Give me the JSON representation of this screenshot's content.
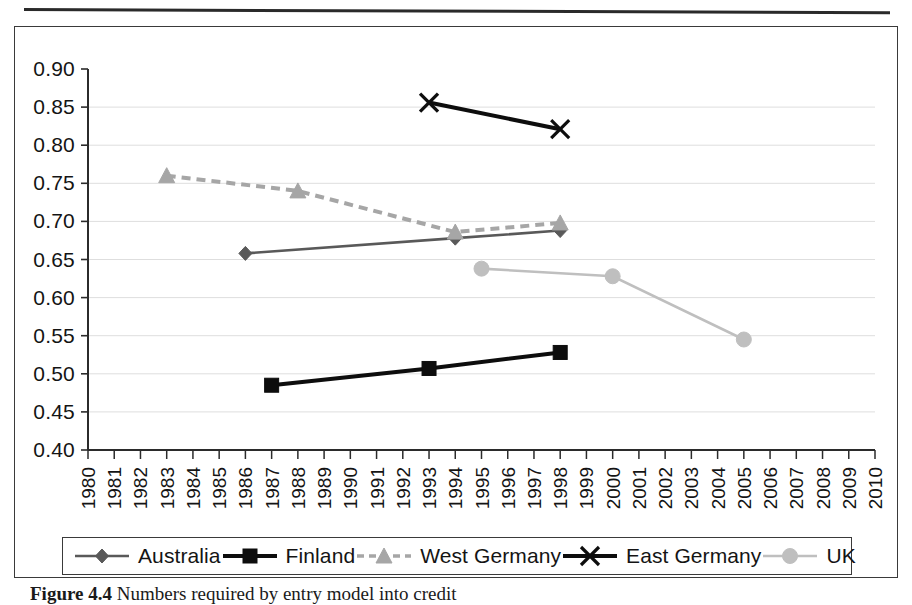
{
  "figure": {
    "caption_label": "Figure 4.4",
    "caption_text": "Numbers required by entry model into credit"
  },
  "legend": {
    "position": "bottom",
    "items": [
      {
        "label": "Australia",
        "marker": "diamond-marker",
        "color": "#595959",
        "line": "solid"
      },
      {
        "label": "Finland",
        "marker": "square-marker",
        "color": "#0d0d0d",
        "line": "solid"
      },
      {
        "label": "West Germany",
        "marker": "triangle-marker",
        "color": "#a6a6a6",
        "line": "dashed"
      },
      {
        "label": "East Germany",
        "marker": "cross-marker",
        "color": "#0d0d0d",
        "line": "solid"
      },
      {
        "label": "UK",
        "marker": "circle-marker",
        "color": "#bfbfbf",
        "line": "solid"
      }
    ]
  },
  "chart_data": {
    "type": "line",
    "title": "",
    "xlabel": "",
    "ylabel": "",
    "xlim": [
      1980,
      2010
    ],
    "ylim": [
      0.4,
      0.9
    ],
    "ytick_step": 0.05,
    "grid": true,
    "grid_axis": "y",
    "x": [
      1980,
      1981,
      1982,
      1983,
      1984,
      1985,
      1986,
      1987,
      1988,
      1989,
      1990,
      1991,
      1992,
      1993,
      1994,
      1995,
      1996,
      1997,
      1998,
      1999,
      2000,
      2001,
      2002,
      2003,
      2004,
      2005,
      2006,
      2007,
      2008,
      2009,
      2010
    ],
    "xtick_labels": [
      "1980",
      "1981",
      "1982",
      "1983",
      "1984",
      "1985",
      "1986",
      "1987",
      "1988",
      "1989",
      "1990",
      "1991",
      "1992",
      "1993",
      "1994",
      "1995",
      "1996",
      "1997",
      "1998",
      "1999",
      "2000",
      "2001",
      "2002",
      "2003",
      "2004",
      "2005",
      "2006",
      "2007",
      "2008",
      "2009",
      "2010"
    ],
    "ytick_labels": [
      "0.90",
      "0.85",
      "0.80",
      "0.75",
      "0.70",
      "0.65",
      "0.60",
      "0.55",
      "0.50",
      "0.45",
      "0.40"
    ],
    "series": [
      {
        "name": "Australia",
        "marker": "diamond",
        "color": "#595959",
        "linestyle": "solid",
        "points": [
          {
            "x": 1986,
            "y": 0.658
          },
          {
            "x": 1994,
            "y": 0.678
          },
          {
            "x": 1998,
            "y": 0.688
          }
        ]
      },
      {
        "name": "Finland",
        "marker": "square",
        "color": "#0d0d0d",
        "linestyle": "solid",
        "points": [
          {
            "x": 1987,
            "y": 0.485
          },
          {
            "x": 1993,
            "y": 0.507
          },
          {
            "x": 1998,
            "y": 0.528
          }
        ]
      },
      {
        "name": "West Germany",
        "marker": "triangle",
        "color": "#a6a6a6",
        "linestyle": "dashed",
        "points": [
          {
            "x": 1983,
            "y": 0.76
          },
          {
            "x": 1988,
            "y": 0.74
          },
          {
            "x": 1994,
            "y": 0.686
          },
          {
            "x": 1998,
            "y": 0.698
          }
        ]
      },
      {
        "name": "East Germany",
        "marker": "cross",
        "color": "#0d0d0d",
        "linestyle": "solid",
        "points": [
          {
            "x": 1993,
            "y": 0.856
          },
          {
            "x": 1998,
            "y": 0.821
          }
        ]
      },
      {
        "name": "UK",
        "marker": "circle",
        "color": "#bfbfbf",
        "linestyle": "solid",
        "points": [
          {
            "x": 1995,
            "y": 0.638
          },
          {
            "x": 2000,
            "y": 0.628
          },
          {
            "x": 2005,
            "y": 0.545
          }
        ]
      }
    ]
  }
}
